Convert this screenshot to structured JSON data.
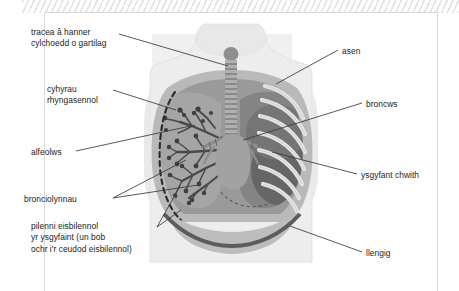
{
  "figure": {
    "kind": "labelled-anatomical-diagram",
    "language": "Welsh",
    "palette": {
      "page_background": "#ffffff",
      "panel_background": "#f0f0f0",
      "frame_border": "#d9d9d9",
      "hatch_stripe": "#e3e3e3",
      "label_text": "#1b1b1b",
      "leader_line": "#3a3a3a",
      "body_outline": "#e6e6e6",
      "body_fill": "#ededed",
      "chest_wall": "#b9b9b9",
      "lung_cavity": "#9a9a9a",
      "lung_dark": "#6e6e6e",
      "trachea": "#a8a8a8",
      "bronchial_tree": "#4a4a4a",
      "rib": "#e0e0e0",
      "diaphragm": "#5c5c5c",
      "pleura_dashed": "#2b2b2b"
    }
  },
  "labels": {
    "tracea": "tracea â hanner\ncylchoedd o gartilag",
    "cyhyrau": "cyhyrau\nrhyngasennol",
    "alfeolws": "alfeolws",
    "bronciolynnau": "bronciolynnau",
    "pilenni": "pilenni eisbilennol\nyr ysgyfaint (un bob\nochr i'r ceudod eisbilennol)",
    "asen": "asen",
    "broncws": "broncws",
    "ysgyfant_chwith": "ysgyfant chwith",
    "llengig": "llengig"
  }
}
